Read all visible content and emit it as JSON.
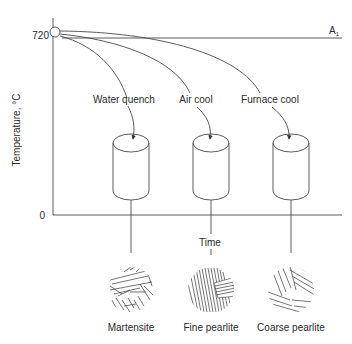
{
  "diagram": {
    "y_axis": {
      "label": "Temperature, °C",
      "ticks": [
        "720",
        "0"
      ]
    },
    "x_axis": {
      "label": "Time"
    },
    "reference_line": {
      "label": "A",
      "subscript": "1"
    },
    "cooling_paths": [
      {
        "label": "Water quench",
        "result": "Martensite"
      },
      {
        "label": "Air cool",
        "result": "Fine pearlite"
      },
      {
        "label": "Furnace cool",
        "result": "Coarse pearlite"
      }
    ]
  }
}
